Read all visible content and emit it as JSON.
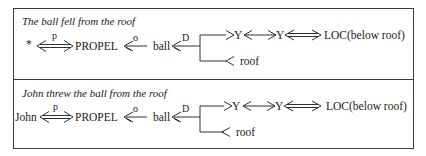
{
  "panels": [
    {
      "title": "The ball fell from the roof",
      "actor": "*",
      "link_actor_label": "p",
      "primitive": "PROPEL",
      "link_object_label": "o",
      "object": "ball",
      "link_direction_label": "D",
      "to_node_1": "Y",
      "to_node_2": "Y",
      "to_result": "LOC(below roof)",
      "from_node": "roof"
    },
    {
      "title": "John threw the ball from the roof",
      "actor": "John",
      "link_actor_label": "p",
      "primitive": "PROPEL",
      "link_object_label": "o",
      "object": "ball",
      "link_direction_label": "D",
      "to_node_1": "Y",
      "to_node_2": "Y",
      "to_result": "LOC(below roof)",
      "from_node": "roof"
    }
  ]
}
